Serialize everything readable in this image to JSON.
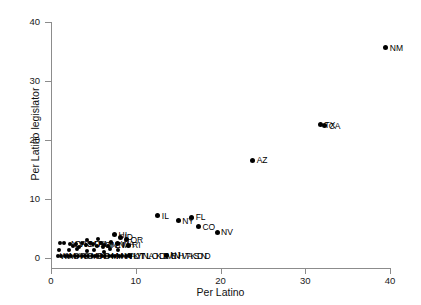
{
  "chart_data": {
    "type": "scatter",
    "title": "",
    "xlabel": "Per Latino",
    "ylabel": "Per Latino legislator",
    "xlim": [
      0,
      42
    ],
    "ylim": [
      0,
      41
    ],
    "xticks": [
      0,
      10,
      20,
      30,
      40
    ],
    "yticks": [
      0,
      10,
      20,
      30,
      40
    ],
    "grid": false,
    "legend": "none",
    "point_color": "#000000",
    "axis_color": "#8c8c8c",
    "labeled_points": [
      {
        "label": "NM",
        "x": 39.5,
        "y": 35.6
      },
      {
        "label": "TX",
        "x": 31.8,
        "y": 22.6
      },
      {
        "label": "CA",
        "x": 32.3,
        "y": 22.4
      },
      {
        "label": "AZ",
        "x": 23.8,
        "y": 16.6
      },
      {
        "label": "IL",
        "x": 12.6,
        "y": 7.2
      },
      {
        "label": "FL",
        "x": 16.6,
        "y": 6.9
      },
      {
        "label": "NY",
        "x": 15.0,
        "y": 6.3
      },
      {
        "label": "CO",
        "x": 17.4,
        "y": 5.3
      },
      {
        "label": "NV",
        "x": 19.6,
        "y": 4.4
      },
      {
        "label": "NJ",
        "x": 13.6,
        "y": 0.5
      },
      {
        "label": "HI",
        "x": 7.5,
        "y": 3.9
      },
      {
        "label": "ID",
        "x": 8.2,
        "y": 3.5
      },
      {
        "label": "OR",
        "x": 8.9,
        "y": 3.1
      },
      {
        "label": "WA",
        "x": 7.8,
        "y": 2.4
      },
      {
        "label": "RI",
        "x": 9.1,
        "y": 2.2
      },
      {
        "label": "UT",
        "x": 9.3,
        "y": 0.4
      }
    ],
    "cluster_points": [
      {
        "x": 1.1,
        "y": 2.6
      },
      {
        "x": 1.5,
        "y": 2.5
      },
      {
        "x": 2.2,
        "y": 2.4
      },
      {
        "x": 3.0,
        "y": 2.3
      },
      {
        "x": 3.6,
        "y": 2.6
      },
      {
        "x": 4.1,
        "y": 2.2
      },
      {
        "x": 4.6,
        "y": 2.5
      },
      {
        "x": 5.0,
        "y": 2.3
      },
      {
        "x": 5.4,
        "y": 2.1
      },
      {
        "x": 5.9,
        "y": 2.6
      },
      {
        "x": 6.3,
        "y": 2.2
      },
      {
        "x": 6.7,
        "y": 2.0
      },
      {
        "x": 7.1,
        "y": 2.7
      },
      {
        "x": 4.3,
        "y": 3.0
      },
      {
        "x": 5.6,
        "y": 3.2
      },
      {
        "x": 6.1,
        "y": 1.8
      },
      {
        "x": 3.3,
        "y": 1.9
      },
      {
        "x": 2.6,
        "y": 2.0
      },
      {
        "x": 0.8,
        "y": 0.4
      },
      {
        "x": 1.2,
        "y": 0.4
      },
      {
        "x": 1.6,
        "y": 0.4
      },
      {
        "x": 2.0,
        "y": 0.4
      },
      {
        "x": 2.4,
        "y": 0.4
      },
      {
        "x": 2.8,
        "y": 0.4
      },
      {
        "x": 3.2,
        "y": 0.4
      },
      {
        "x": 3.6,
        "y": 0.4
      },
      {
        "x": 4.0,
        "y": 0.4
      },
      {
        "x": 4.4,
        "y": 0.4
      },
      {
        "x": 4.8,
        "y": 0.4
      },
      {
        "x": 5.2,
        "y": 0.4
      },
      {
        "x": 5.6,
        "y": 0.4
      },
      {
        "x": 6.0,
        "y": 0.4
      },
      {
        "x": 6.4,
        "y": 0.4
      },
      {
        "x": 6.8,
        "y": 0.4
      },
      {
        "x": 7.2,
        "y": 0.4
      },
      {
        "x": 7.6,
        "y": 0.4
      },
      {
        "x": 8.0,
        "y": 0.4
      },
      {
        "x": 8.4,
        "y": 0.4
      },
      {
        "x": 8.8,
        "y": 0.4
      },
      {
        "x": 1.0,
        "y": 1.4
      },
      {
        "x": 2.1,
        "y": 1.3
      },
      {
        "x": 3.1,
        "y": 1.5
      },
      {
        "x": 4.2,
        "y": 1.2
      },
      {
        "x": 5.1,
        "y": 1.4
      },
      {
        "x": 6.2,
        "y": 1.1
      },
      {
        "x": 7.0,
        "y": 1.5
      },
      {
        "x": 7.9,
        "y": 1.3
      }
    ],
    "cluster_labels": [
      {
        "text": "NCVAKS",
        "x": 2.0,
        "y": 2.45
      },
      {
        "text": "MDPAMA",
        "x": 4.2,
        "y": 2.35
      },
      {
        "text": "CTNENM",
        "x": 6.0,
        "y": 2.2
      },
      {
        "text": "WVMSARSCMOINOHMIMNWIIAKYTNLAOKDEMENHVTAKSDND",
        "x": 0.7,
        "y": 0.42
      }
    ]
  }
}
